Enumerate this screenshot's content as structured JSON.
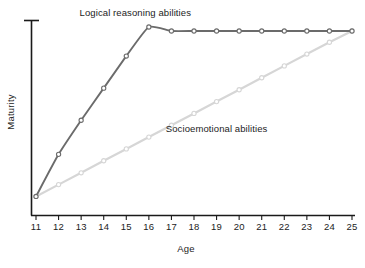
{
  "chart_data": {
    "type": "line",
    "title": "",
    "xlabel": "Age",
    "ylabel": "Maturity",
    "x": [
      11,
      12,
      13,
      14,
      15,
      16,
      17,
      18,
      19,
      20,
      21,
      22,
      23,
      24,
      25
    ],
    "categories": [
      "11",
      "12",
      "13",
      "14",
      "15",
      "16",
      "17",
      "18",
      "19",
      "20",
      "21",
      "22",
      "23",
      "24",
      "25"
    ],
    "xlim": [
      11,
      25
    ],
    "ylim": [
      0,
      100
    ],
    "grid": false,
    "legend_position": "inline-annotation",
    "y_axis_ticks_labeled": false,
    "series": [
      {
        "name": "Logical reasoning abilities",
        "color": "#6b6b6b",
        "label_x": 15.4,
        "label_y": 101,
        "values": [
          9.5,
          30.5,
          47.5,
          63.5,
          79.5,
          94.0,
          92.0,
          92.0,
          92.0,
          92.0,
          92.0,
          92.0,
          92.0,
          92.0,
          92.0
        ]
      },
      {
        "name": "Socioemotional abilities",
        "color": "#d6d6d6",
        "label_x": 19.0,
        "label_y": 43,
        "values": [
          9.5,
          15.4,
          21.3,
          27.3,
          33.2,
          39.1,
          45.0,
          50.9,
          56.8,
          62.7,
          68.7,
          74.6,
          80.5,
          86.4,
          92.0
        ]
      }
    ]
  },
  "annotations": {
    "logical_label": "Logical reasoning abilities",
    "socioemotional_label": "Socioemotional abilities"
  },
  "axes": {
    "x_title": "Age",
    "y_title": "Maturity",
    "x_tick_labels": [
      "11",
      "12",
      "13",
      "14",
      "15",
      "16",
      "17",
      "18",
      "19",
      "20",
      "21",
      "22",
      "23",
      "24",
      "25"
    ]
  },
  "colors": {
    "logical": "#6b6b6b",
    "socioemotional": "#d6d6d6",
    "axis": "#1a1a1a",
    "text": "#1c1c1c",
    "background": "#ffffff"
  }
}
